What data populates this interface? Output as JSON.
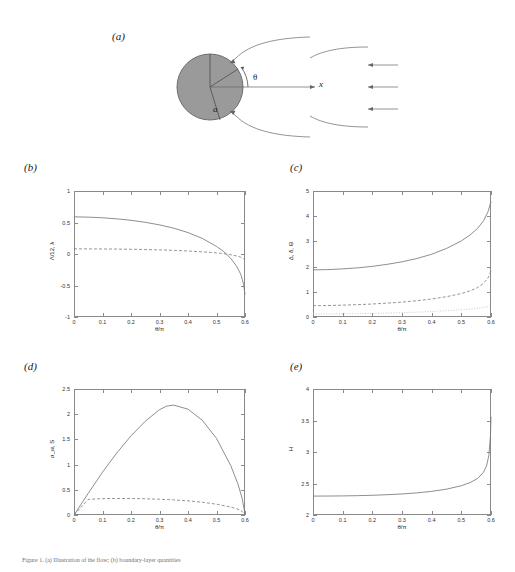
{
  "figure": {
    "panel_labels": {
      "a": "(a)",
      "b": "(b)",
      "c": "(c)",
      "d": "(d)",
      "e": "(e)"
    },
    "caption": "Figure 1. (a) Illustration of the flow; (b) boundary-layer quantities"
  },
  "schematic": {
    "angle_symbol": "θ",
    "radius_symbol": "a",
    "axis_symbol": "x",
    "cylinder_fill": "#9a9a9a",
    "n_freestream_arrows": 3
  },
  "chart_data": [
    {
      "panel": "b",
      "type": "line",
      "title": "",
      "xlabel": "θ/π",
      "ylabel": "Λ/12,  λ",
      "xlim": [
        0,
        0.6
      ],
      "ylim": [
        -1,
        1
      ],
      "xticks": [
        0,
        0.1,
        0.2,
        0.3,
        0.4,
        0.5,
        0.6
      ],
      "xticklabels": [
        "0",
        "0.1",
        "0.2",
        "0.3",
        "0.4",
        "0.5",
        "0.6"
      ],
      "yticks": [
        -1,
        -0.5,
        0,
        0.5,
        1
      ],
      "yticklabels": [
        "-1",
        "-0.5",
        "0",
        "0.5",
        "1"
      ],
      "grid": false,
      "legend": "none",
      "x": [
        0,
        0.05,
        0.1,
        0.15,
        0.2,
        0.25,
        0.3,
        0.35,
        0.4,
        0.45,
        0.5,
        0.525,
        0.55,
        0.57,
        0.585,
        0.595,
        0.6
      ],
      "series": [
        {
          "name": "Λ/12",
          "style": "solid",
          "values": [
            0.59,
            0.585,
            0.575,
            0.558,
            0.535,
            0.503,
            0.462,
            0.41,
            0.34,
            0.248,
            0.12,
            0.04,
            -0.07,
            -0.19,
            -0.32,
            -0.48,
            -0.645
          ]
        },
        {
          "name": "λ",
          "style": "dashed",
          "values": [
            0.082,
            0.081,
            0.08,
            0.078,
            0.075,
            0.071,
            0.065,
            0.058,
            0.048,
            0.035,
            0.018,
            0.006,
            -0.012,
            -0.03,
            -0.05,
            -0.075,
            -0.095
          ]
        }
      ]
    },
    {
      "panel": "c",
      "type": "line",
      "title": "",
      "xlabel": "θ/π",
      "ylabel": "Δ, δ, Θ",
      "xlim": [
        0,
        0.6
      ],
      "ylim": [
        0,
        5
      ],
      "xticks": [
        0,
        0.1,
        0.2,
        0.3,
        0.4,
        0.5,
        0.6
      ],
      "xticklabels": [
        "0",
        "0.1",
        "0.2",
        "0.3",
        "0.4",
        "0.5",
        "0.6"
      ],
      "yticks": [
        0,
        1,
        2,
        3,
        4,
        5
      ],
      "yticklabels": [
        "0",
        "1",
        "2",
        "3",
        "4",
        "5"
      ],
      "grid": false,
      "legend": "none",
      "x": [
        0,
        0.05,
        0.1,
        0.15,
        0.2,
        0.25,
        0.3,
        0.35,
        0.4,
        0.45,
        0.5,
        0.53,
        0.555,
        0.575,
        0.59,
        0.6
      ],
      "series": [
        {
          "name": "Δ",
          "style": "solid",
          "values": [
            1.87,
            1.88,
            1.91,
            1.95,
            2.01,
            2.09,
            2.19,
            2.32,
            2.49,
            2.72,
            3.02,
            3.26,
            3.52,
            3.82,
            4.18,
            4.58
          ]
        },
        {
          "name": "δ",
          "style": "dashed",
          "values": [
            0.45,
            0.455,
            0.47,
            0.49,
            0.515,
            0.55,
            0.59,
            0.645,
            0.715,
            0.805,
            0.93,
            1.04,
            1.17,
            1.34,
            1.55,
            1.82
          ]
        },
        {
          "name": "Θ",
          "style": "dotted",
          "values": [
            0.12,
            0.122,
            0.127,
            0.134,
            0.144,
            0.157,
            0.173,
            0.193,
            0.218,
            0.249,
            0.29,
            0.317,
            0.345,
            0.378,
            0.415,
            0.455
          ]
        }
      ]
    },
    {
      "panel": "d",
      "type": "line",
      "title": "",
      "xlabel": "θ/π",
      "ylabel": "σ_w,  S",
      "xlim": [
        0,
        0.6
      ],
      "ylim": [
        0,
        2.5
      ],
      "xticks": [
        0,
        0.1,
        0.2,
        0.3,
        0.4,
        0.5,
        0.6
      ],
      "xticklabels": [
        "0",
        "0.1",
        "0.2",
        "0.3",
        "0.4",
        "0.5",
        "0.6"
      ],
      "yticks": [
        0,
        0.5,
        1,
        1.5,
        2,
        2.5
      ],
      "yticklabels": [
        "0",
        "0.5",
        "1",
        "1.5",
        "2",
        "2.5"
      ],
      "grid": false,
      "legend": "none",
      "x": [
        0,
        0.05,
        0.1,
        0.15,
        0.2,
        0.25,
        0.3,
        0.325,
        0.35,
        0.4,
        0.45,
        0.5,
        0.55,
        0.575,
        0.59,
        0.6
      ],
      "series": [
        {
          "name": "σ_w",
          "style": "solid",
          "values": [
            0.0,
            0.43,
            0.85,
            1.23,
            1.57,
            1.86,
            2.09,
            2.16,
            2.18,
            2.1,
            1.88,
            1.52,
            0.98,
            0.62,
            0.33,
            0.02
          ]
        },
        {
          "name": "S",
          "style": "dashed",
          "values": [
            0.0,
            0.31,
            0.325,
            0.328,
            0.327,
            0.322,
            0.313,
            0.307,
            0.3,
            0.281,
            0.253,
            0.215,
            0.158,
            0.115,
            0.07,
            0.01
          ]
        }
      ]
    },
    {
      "panel": "e",
      "type": "line",
      "title": "",
      "xlabel": "θ/π",
      "ylabel": "H",
      "xlim": [
        0,
        0.6
      ],
      "ylim": [
        2,
        4
      ],
      "xticks": [
        0,
        0.1,
        0.2,
        0.3,
        0.4,
        0.5,
        0.6
      ],
      "xticklabels": [
        "0",
        "0.1",
        "0.2",
        "0.3",
        "0.4",
        "0.5",
        "0.6"
      ],
      "yticks": [
        2,
        2.5,
        3,
        3.5,
        4
      ],
      "yticklabels": [
        "2",
        "2.5",
        "3",
        "3.5",
        "4"
      ],
      "grid": false,
      "legend": "none",
      "x": [
        0,
        0.05,
        0.1,
        0.15,
        0.2,
        0.25,
        0.3,
        0.35,
        0.4,
        0.45,
        0.5,
        0.53,
        0.555,
        0.575,
        0.585,
        0.593,
        0.598,
        0.6
      ],
      "series": [
        {
          "name": "H",
          "style": "solid",
          "values": [
            2.3,
            2.301,
            2.303,
            2.307,
            2.313,
            2.322,
            2.334,
            2.351,
            2.375,
            2.41,
            2.465,
            2.515,
            2.58,
            2.68,
            2.78,
            2.95,
            3.25,
            3.56
          ]
        }
      ]
    }
  ]
}
